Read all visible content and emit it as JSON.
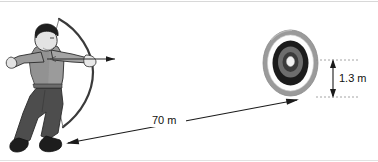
{
  "figure": {
    "background_color": "#ffffff",
    "width": 378,
    "height": 162
  },
  "labels": {
    "distance": "70 m",
    "target_height": "1.3 m"
  },
  "measurements": [
    {
      "name": "shooting-distance",
      "value": 70,
      "unit": "m",
      "text": "70 m",
      "orientation": "horizontal",
      "from": "archer",
      "to": "target"
    },
    {
      "name": "target-diameter",
      "value": 1.3,
      "unit": "m",
      "text": "1.3 m",
      "orientation": "vertical",
      "of": "target"
    }
  ],
  "objects": {
    "archer": {
      "name": "Archer",
      "description": "Person drawing a bow aimed at the target"
    },
    "target": {
      "name": "Archery target",
      "description": "Round target face with concentric rings",
      "rings": [
        {
          "name": "outer-rim",
          "color": "#9a9a9a"
        },
        {
          "name": "white-ring",
          "color": "#fdfdfd"
        },
        {
          "name": "black-ring",
          "color": "#1b1b1b"
        },
        {
          "name": "inner-gray-ring",
          "color": "#6d6d6d"
        },
        {
          "name": "inner-dark-ring",
          "color": "#3b3b3b"
        },
        {
          "name": "bullseye",
          "color": "#f2f2f2"
        }
      ]
    }
  },
  "colors": {
    "shirt": "#9b9b9b",
    "pants": "#4d4d4d",
    "shoes": "#1d1d1d",
    "hair": "#1f1f1f",
    "skin": "#e3e3e3",
    "bow": "#3a3a3a",
    "outline": "#2a2a2a",
    "frame_line": "#cfcfcf",
    "text": "#111111"
  }
}
